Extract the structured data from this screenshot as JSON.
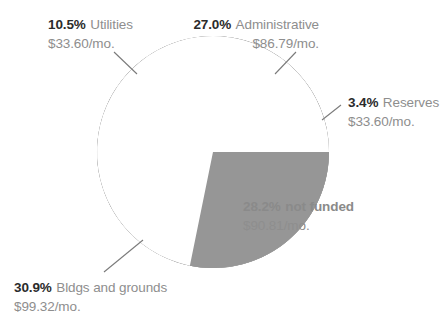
{
  "chart_data": {
    "type": "pie",
    "title": "",
    "subtitle": "",
    "xlabel": "",
    "ylabel": "",
    "legend_position": "callout-labels",
    "grid": false,
    "units": "percent of monthly assessment",
    "total_label": "",
    "slices": [
      {
        "label": "Administrative",
        "percent": 27.0,
        "percent_text": "27.0%",
        "amount_text": "$86.79/mo.",
        "amount_value": 86.79,
        "color": "#a9a9a9",
        "start_angle_deg": 347.7,
        "end_angle_deg": 250.5
      },
      {
        "label": "Utilities",
        "percent": 10.5,
        "percent_text": "10.5%",
        "amount_text": "$33.60/mo.",
        "amount_value": 33.6,
        "color": "#9b9b9b",
        "start_angle_deg": 250.5,
        "end_angle_deg": 212.7
      },
      {
        "label": "Bldgs and grounds",
        "percent": 30.9,
        "percent_text": "30.9%",
        "amount_text": "$99.32/mo.",
        "amount_value": 99.32,
        "color": "#8c8c8c",
        "start_angle_deg": 212.7,
        "end_angle_deg": 101.5
      },
      {
        "label": "Reserves",
        "percent": 3.4,
        "percent_text": "3.4%",
        "amount_text": "$33.60/mo.",
        "amount_value": 33.6,
        "color": "#969696",
        "start_angle_deg": 0.0,
        "end_angle_deg": 347.7
      },
      {
        "label": "not funded",
        "percent": 28.2,
        "percent_text": "28.2%",
        "amount_text": "$90.81/mo.",
        "amount_value": 90.81,
        "color": "#ffffff",
        "start_angle_deg": 101.5,
        "end_angle_deg": 0.0
      }
    ],
    "categories": [
      "Administrative",
      "Utilities",
      "Bldgs and grounds",
      "Reserves",
      "not funded"
    ],
    "values": [
      27.0,
      10.5,
      30.9,
      3.4,
      28.2
    ]
  },
  "labels": {
    "utilities": {
      "percent": "10.5%",
      "name": "Utilities",
      "amount": "$33.60/mo."
    },
    "administrative": {
      "percent": "27.0%",
      "name": "Administrative",
      "amount": "$86.79/mo."
    },
    "reserves": {
      "percent": "3.4%",
      "name": "Reserves",
      "amount": "$33.60/mo."
    },
    "not_funded": {
      "percent": "28.2%",
      "name": "not funded",
      "amount": "$90.81/mo."
    },
    "bldgs": {
      "percent": "30.9%",
      "name": "Bldgs and grounds",
      "amount": "$99.32/mo."
    }
  },
  "colors": {
    "administrative": "#a9a9a9",
    "utilities": "#9b9b9b",
    "bldgs": "#8c8c8c",
    "reserves": "#969696",
    "not_funded": "#ffffff",
    "label_text": "#8e8e8e",
    "percent_text": "#2b2b2b",
    "muted_text": "#8a8a8a",
    "leader_line": "#7a7a7a",
    "background": "#ffffff"
  }
}
